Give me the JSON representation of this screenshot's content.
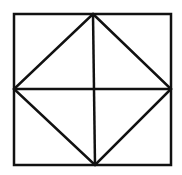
{
  "diagram": {
    "stroke_color": "#111111",
    "background": "#ffffff",
    "square": {
      "x1": 14,
      "y1": 14,
      "x2": 171,
      "y2": 165
    },
    "diamond": {
      "top": [
        93,
        14
      ],
      "right": [
        171,
        89
      ],
      "bottom": [
        95,
        165
      ],
      "left": [
        14,
        89
      ]
    },
    "midlines": {
      "vertical": {
        "from": [
          93,
          14
        ],
        "to": [
          95,
          165
        ]
      },
      "horizontal": {
        "from": [
          14,
          89
        ],
        "to": [
          171,
          89
        ]
      }
    }
  }
}
